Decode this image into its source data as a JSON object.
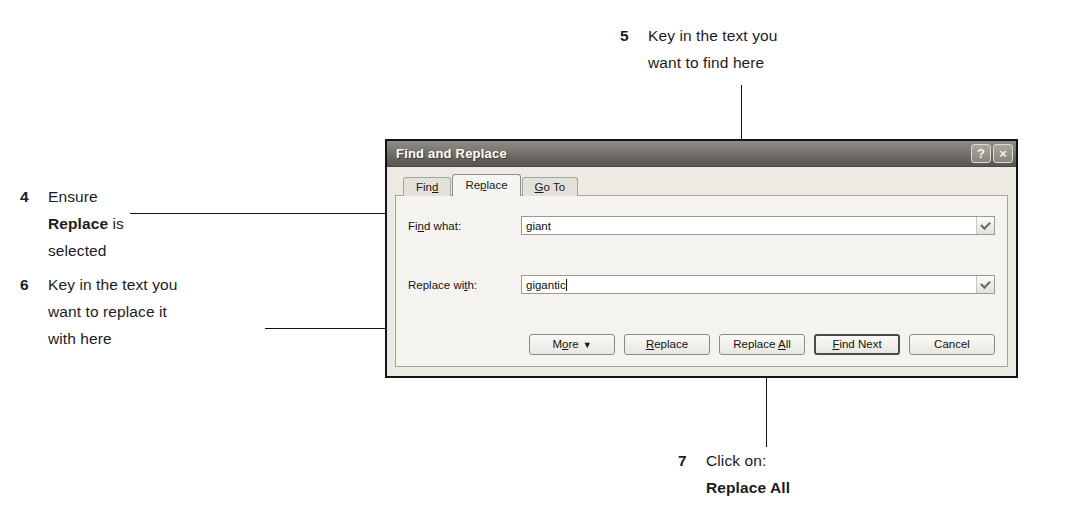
{
  "steps": [
    {
      "number": "4",
      "line1": "Ensure",
      "line2_bold": "Replace",
      "line2_rest": " is",
      "line3": "selected"
    },
    {
      "number": "5",
      "line1": "Key in the text you",
      "line2": "want to find here"
    },
    {
      "number": "6",
      "line1": "Key in the text you",
      "line2": "want to replace it",
      "line3": "with here"
    },
    {
      "number": "7",
      "line1": "Click on:",
      "line2_bold": "Replace All"
    }
  ],
  "dialog": {
    "title": "Find and Replace",
    "titlebar_buttons": [
      {
        "name": "help-icon",
        "glyph": "?"
      },
      {
        "name": "close-icon",
        "glyph": "×"
      }
    ],
    "tabs": [
      {
        "label": "Fin",
        "accel": "d",
        "tail": "",
        "active": false
      },
      {
        "label": "Re",
        "accel": "p",
        "tail": "lace",
        "active": true
      },
      {
        "label": "",
        "accel": "G",
        "tail": "o To",
        "active": false
      }
    ],
    "fields": [
      {
        "label_pre": "Fi",
        "label_accel": "n",
        "label_post": "d what:",
        "value": "giant",
        "has_caret": false,
        "dropdown_icon": "chevron-down-icon"
      },
      {
        "label_pre": "Replace wi",
        "label_accel": "t",
        "label_post": "h:",
        "value": "gigantic",
        "has_caret": true,
        "dropdown_icon": "chevron-down-icon"
      }
    ],
    "buttons": [
      {
        "name": "more-button",
        "pre": "M",
        "accel": "o",
        "post": "re",
        "dropdown": "▼",
        "default": false
      },
      {
        "name": "replace-button",
        "pre": "",
        "accel": "R",
        "post": "eplace",
        "dropdown": "",
        "default": false
      },
      {
        "name": "replace-all-button",
        "pre": "Replace ",
        "accel": "A",
        "post": "ll",
        "dropdown": "",
        "default": false
      },
      {
        "name": "find-next-button",
        "pre": "",
        "accel": "F",
        "post": "ind Next",
        "dropdown": "",
        "default": true
      },
      {
        "name": "cancel-button",
        "pre": "Cancel",
        "accel": "",
        "post": "",
        "dropdown": "",
        "default": false
      }
    ]
  }
}
